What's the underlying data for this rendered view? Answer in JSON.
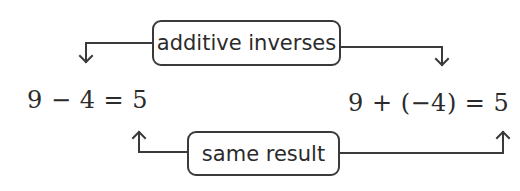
{
  "diagram": {
    "top_label": "additive inverses",
    "bottom_label": "same result",
    "left_equation": "9 − 4 = 5",
    "right_equation": "9 + (−4) = 5",
    "line_color": "#3a3a3a",
    "text_color": "#2b2b2b"
  }
}
